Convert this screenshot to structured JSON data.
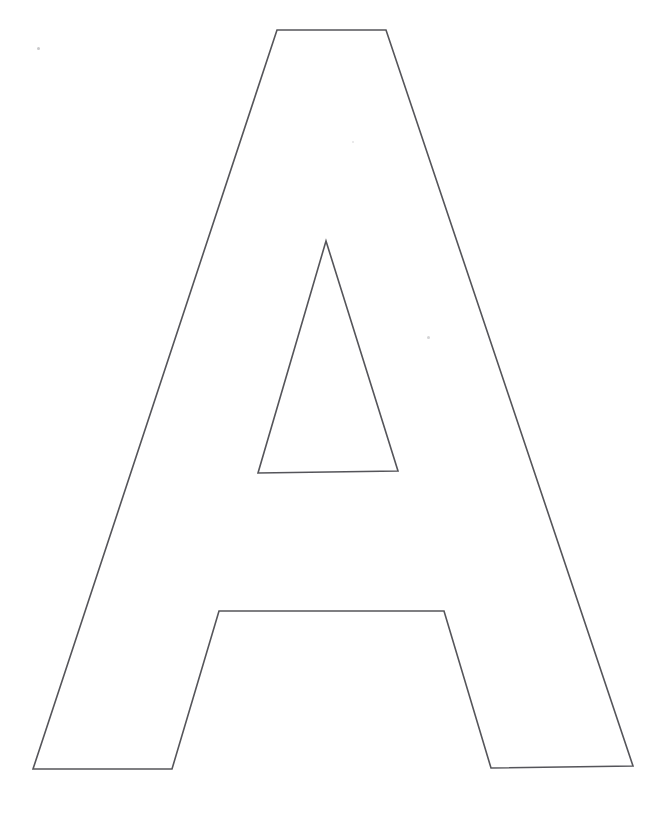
{
  "page": {
    "title": "Letter A Template",
    "background_color": "#ffffff",
    "width": 664,
    "height": 820
  },
  "artwork": {
    "name": "uppercase-letter-a-outline",
    "glyph": "A",
    "description": "Line-art outline of the capital letter A, a printable alphabet template",
    "stroke_color": "#55555a",
    "stroke_width": 1.6,
    "fill_color": "none",
    "outer_outline": {
      "name": "letter-a-outer-contour",
      "points": "277,30 386,30 633,766 491,768 444,611 219,611 172,769 33,769",
      "vertices": [
        {
          "label": "apex-top-left",
          "x": 277,
          "y": 30
        },
        {
          "label": "apex-top-right",
          "x": 386,
          "y": 30
        },
        {
          "label": "right-leg-bottom-outer",
          "x": 633,
          "y": 766
        },
        {
          "label": "right-leg-bottom-inner",
          "x": 491,
          "y": 768
        },
        {
          "label": "crossbar-top-right",
          "x": 444,
          "y": 611
        },
        {
          "label": "crossbar-top-left",
          "x": 219,
          "y": 611
        },
        {
          "label": "left-leg-bottom-inner",
          "x": 172,
          "y": 769
        },
        {
          "label": "left-leg-bottom-outer",
          "x": 33,
          "y": 769
        }
      ]
    },
    "inner_counter": {
      "name": "letter-a-counter-triangle",
      "points": "326,241 398,471 258,473",
      "vertices": [
        {
          "label": "counter-apex",
          "x": 326,
          "y": 241
        },
        {
          "label": "counter-base-right",
          "x": 398,
          "y": 471
        },
        {
          "label": "counter-base-left",
          "x": 258,
          "y": 473
        }
      ]
    }
  },
  "artifacts": {
    "name": "scan-specks",
    "items": [
      {
        "name": "scan-speck-top-left",
        "x": 37,
        "y": 47,
        "size": 3,
        "color": "#9a9a9e",
        "opacity": 0.55
      },
      {
        "name": "scan-speck-upper-middle",
        "x": 352,
        "y": 141,
        "size": 2,
        "color": "#b8b8bc",
        "opacity": 0.4
      },
      {
        "name": "scan-speck-right-middle",
        "x": 427,
        "y": 336,
        "size": 3,
        "color": "#a8a8ac",
        "opacity": 0.5
      }
    ]
  }
}
